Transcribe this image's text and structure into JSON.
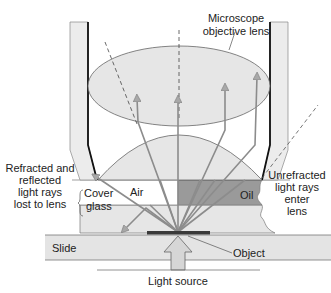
{
  "diagram": {
    "labels": {
      "objective_line1": "Microscope",
      "objective_line2": "objective lens",
      "air": "Air",
      "oil": "Oil",
      "lost_line1": "Refracted and",
      "lost_line2": "reflected",
      "lost_line3": "light rays",
      "lost_line4": "lost to lens",
      "cover_line1": "Cover",
      "cover_line2": "glass",
      "unrefracted_line1": "Unrefracted",
      "unrefracted_line2": "light rays",
      "unrefracted_line3": "enter",
      "unrefracted_line4": "lens",
      "slide": "Slide",
      "object": "Object",
      "light_source": "Light source"
    },
    "colors": {
      "background": "#ffffff",
      "lens_fill": "#e6e6e6",
      "housing_fill": "#ececec",
      "oil_fill": "#9a9a9a",
      "cover_glass_fill": "#e4e4e4",
      "slide_fill": "#e4e4e4",
      "ray_color": "#8c8c8c",
      "object_color": "#3a3a3a",
      "outline": "#555555"
    }
  }
}
